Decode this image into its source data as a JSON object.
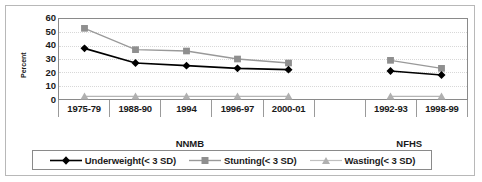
{
  "chart_data": {
    "type": "line",
    "title": "",
    "xlabel": "",
    "ylabel": "Percent",
    "ylim": [
      0,
      60
    ],
    "ytick_step": 10,
    "yticks": [
      60,
      50,
      40,
      30,
      20,
      10,
      0
    ],
    "grid": true,
    "legend_position": "bottom",
    "categories": [
      "1975-79",
      "1988-90",
      "1994",
      "1996-97",
      "2000-01",
      "",
      "1992-93",
      "1998-99"
    ],
    "groups": [
      {
        "label": "NNMB",
        "categories": [
          "1975-79",
          "1988-90",
          "1994",
          "1996-97",
          "2000-01"
        ]
      },
      {
        "label": "NFHS",
        "categories": [
          "1992-93",
          "1998-99"
        ]
      }
    ],
    "series": [
      {
        "name": "Underweight(< 3 SD)",
        "color": "#000000",
        "marker": "diamond",
        "values": [
          38,
          27,
          25,
          23,
          22,
          null,
          21,
          18
        ]
      },
      {
        "name": "Stunting(< 3 SD)",
        "color": "#999999",
        "marker": "square",
        "values": [
          53,
          37,
          36,
          30,
          27,
          null,
          29,
          23
        ]
      },
      {
        "name": "Wasting(< 3 SD)",
        "color": "#b5b5b5",
        "marker": "triangle",
        "values": [
          2,
          2,
          2,
          2,
          2,
          null,
          2,
          2
        ]
      }
    ]
  },
  "axis": {
    "y_title": "Percent",
    "y_tick_0": "0",
    "y_tick_10": "10",
    "y_tick_20": "20",
    "y_tick_30": "30",
    "y_tick_40": "40",
    "y_tick_50": "50",
    "y_tick_60": "60"
  },
  "xaxis": {
    "cells": [
      "1975-79",
      "1988-90",
      "1994",
      "1996-97",
      "2000-01",
      "",
      "1992-93",
      "1998-99"
    ]
  },
  "groups": {
    "nnmb": "NNMB",
    "nfhs": "NFHS"
  },
  "legend": {
    "items": [
      {
        "label": "Underweight(< 3 SD)",
        "icon": "line-diamond-marker-icon",
        "color": "#000000"
      },
      {
        "label": "Stunting(< 3 SD)",
        "icon": "line-square-marker-icon",
        "color": "#999999"
      },
      {
        "label": "Wasting(< 3 SD)",
        "icon": "line-triangle-marker-icon",
        "color": "#b5b5b5"
      }
    ]
  }
}
